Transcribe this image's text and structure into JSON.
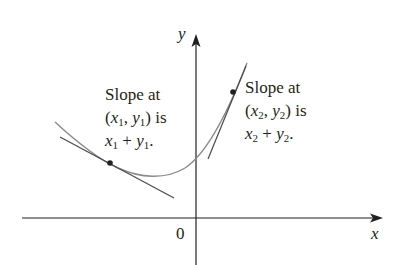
{
  "diagram": {
    "axes": {
      "x_label": "x",
      "y_label": "y",
      "origin_label": "0"
    },
    "annotation_left": {
      "line1": "Slope at",
      "line2_open": "(",
      "line2_x": "x",
      "line2_xsub": "1",
      "line2_comma": ", ",
      "line2_y": "y",
      "line2_ysub": "1",
      "line2_close": ") is",
      "line3_x": "x",
      "line3_xsub": "1",
      "line3_plus": " + ",
      "line3_y": "y",
      "line3_ysub": "1",
      "line3_end": "."
    },
    "annotation_right": {
      "line1": "Slope at",
      "line2_open": "(",
      "line2_x": "x",
      "line2_xsub": "2",
      "line2_comma": ", ",
      "line2_y": "y",
      "line2_ysub": "2",
      "line2_close": ") is",
      "line3_x": "x",
      "line3_xsub": "2",
      "line3_plus": " + ",
      "line3_y": "y",
      "line3_ysub": "2",
      "line3_end": "."
    },
    "colors": {
      "axis": "#231f20",
      "curve": "#8a8a8a",
      "tangent": "#4a4a4a",
      "point": "#231f20"
    }
  }
}
